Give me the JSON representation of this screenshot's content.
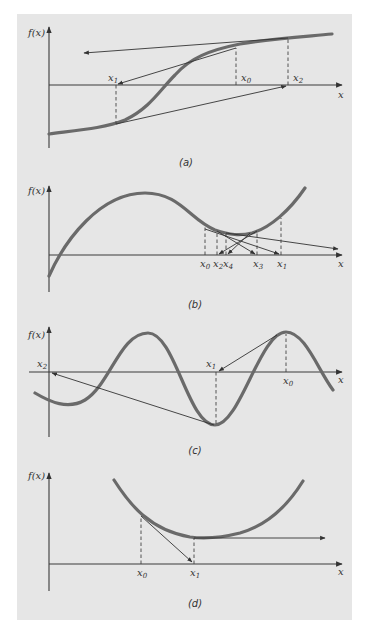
{
  "figure": {
    "background_color": "#e6e6e6",
    "curve_color": "#6a6a6a",
    "panels": [
      {
        "id": "a",
        "caption": "(a)",
        "y_label": "f(x)",
        "x_label": "x",
        "points": [
          {
            "name": "x",
            "sub": "1"
          },
          {
            "name": "x",
            "sub": "0"
          },
          {
            "name": "x",
            "sub": "2"
          }
        ],
        "description": "Sigmoid curve; Newton iterates diverge away from the inflection-point root"
      },
      {
        "id": "b",
        "caption": "(b)",
        "y_label": "f(x)",
        "x_label": "x",
        "points": [
          {
            "name": "x",
            "sub": "0"
          },
          {
            "name": "x",
            "sub": "2"
          },
          {
            "name": "x",
            "sub": "4"
          },
          {
            "name": "x",
            "sub": "3"
          },
          {
            "name": "x",
            "sub": "1"
          }
        ],
        "description": "Iterates oscillate around a local minimum"
      },
      {
        "id": "c",
        "caption": "(c)",
        "y_label": "f(x)",
        "x_label": "x",
        "points": [
          {
            "name": "x",
            "sub": "2"
          },
          {
            "name": "x",
            "sub": "1"
          },
          {
            "name": "x",
            "sub": "0"
          }
        ],
        "description": "Near-zero slope makes the iterate jump far away to a different root region"
      },
      {
        "id": "d",
        "caption": "(d)",
        "y_label": "f(x)",
        "x_label": "x",
        "points": [
          {
            "name": "x",
            "sub": "0"
          },
          {
            "name": "x",
            "sub": "1"
          }
        ],
        "description": "Zero slope at x1 sends the tangent line parallel to the x axis"
      }
    ]
  }
}
